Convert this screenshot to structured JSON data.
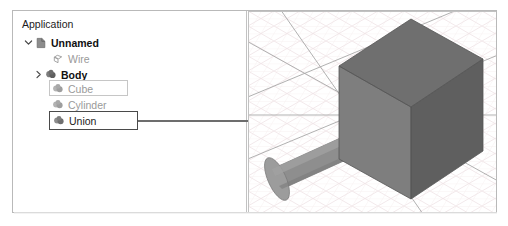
{
  "app": {
    "frame_border_color": "#b9b9b9",
    "background": "#ffffff"
  },
  "tree": {
    "root_label": "Application",
    "items": [
      {
        "label": "Unnamed",
        "icon": "document-icon",
        "style": "bold",
        "depth": 0,
        "twisty": "chevron-down-icon"
      },
      {
        "label": "Wire",
        "icon": "wire-solid-icon",
        "style": "dimmed",
        "depth": 1,
        "twisty": "none"
      },
      {
        "label": "Body",
        "icon": "body-solid-icon",
        "style": "bold",
        "depth": 1,
        "twisty": "chevron-right-icon"
      },
      {
        "label": "Cube",
        "icon": "shape-solid-icon",
        "style": "dimmed",
        "depth": 2,
        "twisty": "none"
      },
      {
        "label": "Cylinder",
        "icon": "shape-solid-icon",
        "style": "dimmed",
        "depth": 2,
        "twisty": "none"
      },
      {
        "label": "Union",
        "icon": "shape-solid-icon",
        "style": "normal",
        "depth": 2,
        "twisty": "none"
      }
    ],
    "highlights": {
      "cube_box_color": "#c6c6c6",
      "union_box_color": "#4a4a4a"
    }
  },
  "callout": {
    "line_color": "#6d6d6d",
    "from_item": "Union"
  },
  "viewport": {
    "background": "#ffffff",
    "grid_color": "#efe4e6",
    "grid_minor_color": "#f3eaec",
    "axis_color": "#9a9a9a",
    "solid_top_color": "#6e6e6e",
    "solid_front_color": "#808080",
    "solid_side_color": "#5e5e5e",
    "cylinder_color": "#8c8c8c",
    "scene_objects": [
      "cube",
      "cylinder"
    ]
  }
}
